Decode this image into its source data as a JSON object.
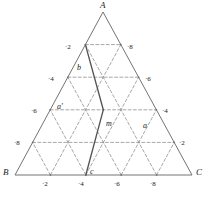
{
  "figure": {
    "type": "ternary-grid-triangle",
    "stroke_color": "#6b6b6b",
    "bold_color": "#555555",
    "dash_color": "#8a8a8a",
    "text_color": "#1a1a1a",
    "background": "#ffffff"
  },
  "vertices": [
    {
      "id": "A",
      "label": "A",
      "x": 103,
      "y": 12,
      "label_x": 100,
      "label_y": 1
    },
    {
      "id": "B",
      "label": "B",
      "x": 15,
      "y": 175,
      "label_x": 3,
      "label_y": 168
    },
    {
      "id": "C",
      "label": "C",
      "x": 192,
      "y": 175,
      "label_x": 196,
      "label_y": 168
    }
  ],
  "interior_labels": [
    {
      "id": "b",
      "label": "b",
      "x": 77,
      "y": 64
    },
    {
      "id": "a2",
      "label": "a'",
      "x": 57,
      "y": 103
    },
    {
      "id": "m",
      "label": "m",
      "x": 106,
      "y": 120
    },
    {
      "id": "a",
      "label": "a",
      "x": 143,
      "y": 122
    },
    {
      "id": "c",
      "label": "c",
      "x": 90,
      "y": 168
    }
  ],
  "edge_ticks": {
    "left": {
      "edge": "A-B",
      "labels": [
        "·2",
        "·4",
        "·6",
        "·8"
      ],
      "positions": [
        {
          "text": "·2",
          "x": 65,
          "y": 44
        },
        {
          "text": "·4",
          "x": 48,
          "y": 76
        },
        {
          "text": "·6",
          "x": 31,
          "y": 108
        },
        {
          "text": "·8",
          "x": 14,
          "y": 140
        }
      ]
    },
    "right": {
      "edge": "A-C",
      "labels": [
        "·8",
        "·6",
        "·4",
        "·2"
      ],
      "positions": [
        {
          "text": "·8",
          "x": 127,
          "y": 44
        },
        {
          "text": "·6",
          "x": 145,
          "y": 76
        },
        {
          "text": "·4",
          "x": 162,
          "y": 108
        },
        {
          "text": "·2",
          "x": 179,
          "y": 140
        }
      ]
    },
    "bottom": {
      "edge": "B-C",
      "labels": [
        "·2",
        "·4",
        "·6",
        "·8"
      ],
      "positions": [
        {
          "text": "·2",
          "x": 42,
          "y": 181
        },
        {
          "text": "·4",
          "x": 78,
          "y": 181
        },
        {
          "text": "·6",
          "x": 114,
          "y": 181
        },
        {
          "text": "·8",
          "x": 150,
          "y": 181
        }
      ]
    }
  },
  "grid": {
    "divisions": 5,
    "style": "dashed",
    "directions": [
      "horizontal",
      "left-leaning",
      "right-leaning"
    ]
  },
  "bold_path": {
    "name": "b-m-c",
    "points": [
      "b",
      "m",
      "c"
    ],
    "style": "solid"
  }
}
